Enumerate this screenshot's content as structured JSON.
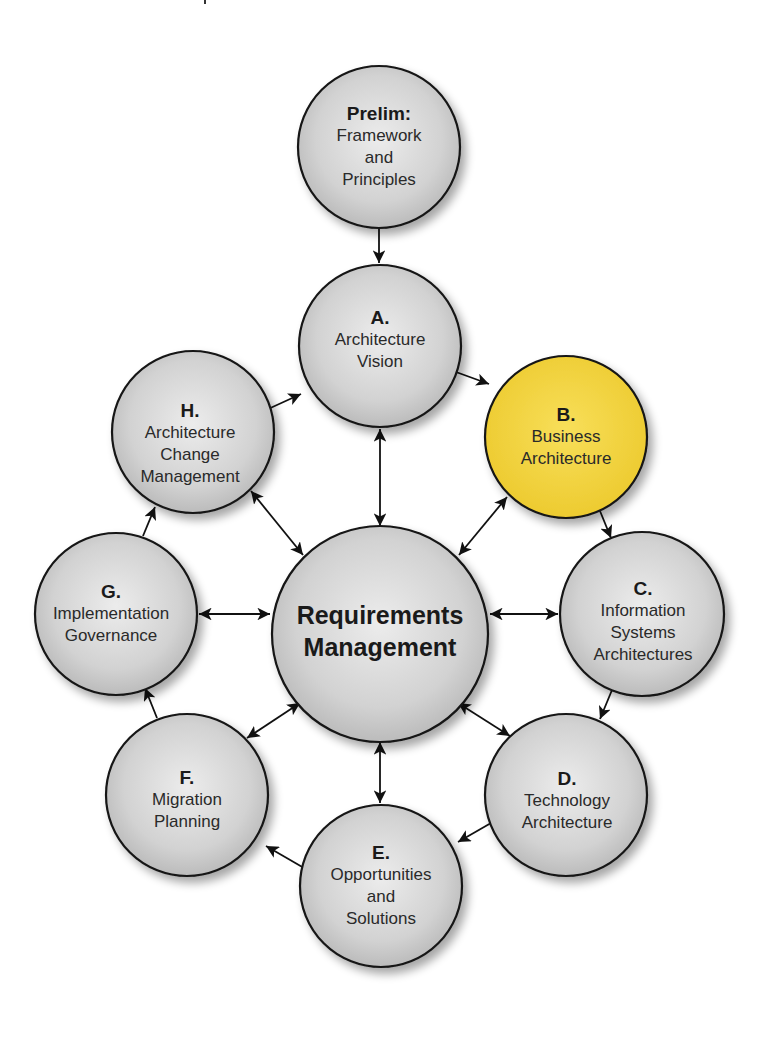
{
  "diagram": {
    "colors": {
      "node_fill": "#d4d4d4",
      "node_highlight_fill": "#f2d23c",
      "stroke": "#1a1a1a",
      "background": "#ffffff"
    },
    "center": {
      "id": "requirements",
      "line1": "Requirements",
      "line2": "Management"
    },
    "nodes": [
      {
        "id": "prelim",
        "code": "Prelim:",
        "lines": [
          "Framework",
          "and",
          "Principles"
        ]
      },
      {
        "id": "a",
        "code": "A.",
        "lines": [
          "Architecture",
          "Vision"
        ]
      },
      {
        "id": "b",
        "code": "B.",
        "lines": [
          "Business",
          "Architecture"
        ],
        "highlighted": true
      },
      {
        "id": "c",
        "code": "C.",
        "lines": [
          "Information",
          "Systems",
          "Architectures"
        ]
      },
      {
        "id": "d",
        "code": "D.",
        "lines": [
          "Technology",
          "Architecture"
        ]
      },
      {
        "id": "e",
        "code": "E.",
        "lines": [
          "Opportunities",
          "and",
          "Solutions"
        ]
      },
      {
        "id": "f",
        "code": "F.",
        "lines": [
          "Migration",
          "Planning"
        ]
      },
      {
        "id": "g",
        "code": "G.",
        "lines": [
          "Implementation",
          "Governance"
        ]
      },
      {
        "id": "h",
        "code": "H.",
        "lines": [
          "Architecture",
          "Change",
          "Management"
        ]
      }
    ],
    "edges": [
      {
        "from": "prelim",
        "to": "a",
        "type": "one-way"
      },
      {
        "from": "a",
        "to": "b",
        "type": "one-way"
      },
      {
        "from": "b",
        "to": "c",
        "type": "one-way"
      },
      {
        "from": "c",
        "to": "d",
        "type": "one-way"
      },
      {
        "from": "d",
        "to": "e",
        "type": "one-way"
      },
      {
        "from": "e",
        "to": "f",
        "type": "one-way"
      },
      {
        "from": "f",
        "to": "g",
        "type": "one-way"
      },
      {
        "from": "g",
        "to": "h",
        "type": "one-way"
      },
      {
        "from": "h",
        "to": "a",
        "type": "one-way"
      },
      {
        "from": "requirements",
        "to": "a",
        "type": "two-way"
      },
      {
        "from": "requirements",
        "to": "b",
        "type": "two-way"
      },
      {
        "from": "requirements",
        "to": "c",
        "type": "two-way"
      },
      {
        "from": "requirements",
        "to": "d",
        "type": "two-way"
      },
      {
        "from": "requirements",
        "to": "e",
        "type": "two-way"
      },
      {
        "from": "requirements",
        "to": "f",
        "type": "two-way"
      },
      {
        "from": "requirements",
        "to": "g",
        "type": "two-way"
      },
      {
        "from": "requirements",
        "to": "h",
        "type": "two-way"
      }
    ]
  }
}
